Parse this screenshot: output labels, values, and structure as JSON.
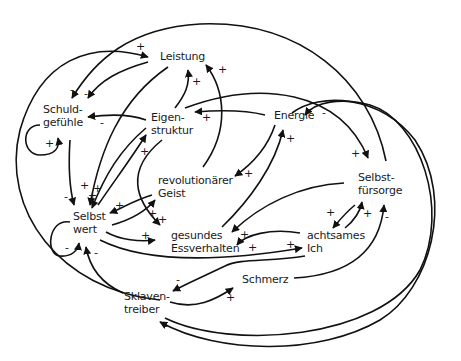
{
  "diagram": {
    "type": "causal-loop-diagram",
    "nodes": {
      "leistung": {
        "line1": "Leistung"
      },
      "schuldgefuehle": {
        "line1": "Schuld-",
        "line2": "gefühle"
      },
      "eigenstruktur": {
        "line1": "Eigen-",
        "line2": "struktur"
      },
      "energie": {
        "line1": "Energie"
      },
      "revolutionaerer_geist": {
        "line1": "revolutionärer",
        "line2": "Geist"
      },
      "selbstfuersorge": {
        "line1": "Selbst-",
        "line2": "fürsorge"
      },
      "selbstwert": {
        "line1": "Selbst",
        "line2": "wert"
      },
      "gesundes_essverhalten": {
        "line1": "gesundes",
        "line2": "Essverhalten"
      },
      "achtsames_ich": {
        "line1": "achtsames",
        "line2": "Ich"
      },
      "schmerz": {
        "line1": "Schmerz"
      },
      "sklaventreiber": {
        "line1": "Sklaven-",
        "line2": "treiber"
      }
    },
    "signs": [
      "+",
      "-",
      "-",
      "+",
      "+",
      "+",
      "-",
      "+",
      "-",
      "+",
      "+",
      "+",
      "+",
      "+",
      "+",
      "+",
      "+",
      "+",
      "-",
      "-",
      "+",
      "+",
      "+",
      "+",
      "+",
      "+",
      "-",
      "-",
      "+",
      "-",
      "-",
      "+"
    ],
    "edges": [
      {
        "from": "Sklaventreiber",
        "to": "Leistung",
        "polarity": "+"
      },
      {
        "from": "Leistung",
        "to": "Schuldgefühle",
        "polarity": "-"
      },
      {
        "from": "Selbstfürsorge",
        "to": "Schuldgefühle",
        "polarity": "-"
      },
      {
        "from": "Eigenstruktur",
        "to": "Schuldgefühle",
        "polarity": "-"
      },
      {
        "from": "Schuldgefühle",
        "to": "Schuldgefühle",
        "polarity": "+"
      },
      {
        "from": "Schuldgefühle",
        "to": "Selbstwert",
        "polarity": "-"
      },
      {
        "from": "Leistung",
        "to": "Selbstwert",
        "polarity": "+"
      },
      {
        "from": "Eigenstruktur",
        "to": "Leistung",
        "polarity": "+"
      },
      {
        "from": "revolutionärer Geist",
        "to": "Leistung",
        "polarity": "+"
      },
      {
        "from": "Energie",
        "to": "Eigenstruktur",
        "polarity": "+"
      },
      {
        "from": "Selbstwert",
        "to": "Eigenstruktur",
        "polarity": "+"
      },
      {
        "from": "Eigenstruktur",
        "to": "Selbstwert",
        "polarity": "+"
      },
      {
        "from": "Eigenstruktur",
        "to": "gesundes Essverhalten",
        "polarity": "+"
      },
      {
        "from": "Energie",
        "to": "revolutionärer Geist",
        "polarity": "+"
      },
      {
        "from": "gesundes Essverhalten",
        "to": "Energie",
        "polarity": "+"
      },
      {
        "from": "revolutionärer Geist",
        "to": "Selbstwert",
        "polarity": "+"
      },
      {
        "from": "Selbstwert",
        "to": "revolutionärer Geist",
        "polarity": "+"
      },
      {
        "from": "Selbstwert",
        "to": "gesundes Essverhalten",
        "polarity": "+"
      },
      {
        "from": "Selbstwert",
        "to": "Selbstwert",
        "polarity": "-"
      },
      {
        "from": "Sklaventreiber",
        "to": "Selbstwert",
        "polarity": "-"
      },
      {
        "from": "Selbstwert",
        "to": "achtsames Ich",
        "polarity": "+"
      },
      {
        "from": "achtsames Ich",
        "to": "gesundes Essverhalten",
        "polarity": "+"
      },
      {
        "from": "Selbstfürsorge",
        "to": "gesundes Essverhalten",
        "polarity": "+"
      },
      {
        "from": "Eigenstruktur",
        "to": "Selbstfürsorge",
        "polarity": "+"
      },
      {
        "from": "Selbstfürsorge",
        "to": "achtsames Ich",
        "polarity": "+"
      },
      {
        "from": "achtsames Ich",
        "to": "Selbstfürsorge",
        "polarity": "+"
      },
      {
        "from": "Schmerz",
        "to": "Selbstfürsorge",
        "polarity": "-"
      },
      {
        "from": "achtsames Ich",
        "to": "Sklaventreiber",
        "polarity": "-"
      },
      {
        "from": "Sklaventreiber",
        "to": "Schmerz",
        "polarity": "+"
      },
      {
        "from": "Sklaventreiber",
        "to": "Energie",
        "polarity": "-"
      },
      {
        "from": "Selbstfürsorge",
        "to": "Sklaventreiber",
        "polarity": "-"
      }
    ]
  }
}
